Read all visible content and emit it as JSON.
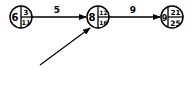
{
  "nodes": [
    {
      "id": "n1",
      "left": "6",
      "top_right": "3",
      "bottom_right": "11"
    },
    {
      "id": "n2",
      "left": "8",
      "top_right": "12",
      "bottom_right": "16"
    },
    {
      "id": "n3",
      "left": "9",
      "top_right": "21",
      "bottom_right": "25"
    }
  ],
  "edges": [
    {
      "from": "n1",
      "to": "n2",
      "label": "5"
    },
    {
      "from": "n2",
      "to": "n3",
      "label": "9"
    },
    {
      "from": "incoming",
      "to": "n2",
      "label": ""
    }
  ]
}
